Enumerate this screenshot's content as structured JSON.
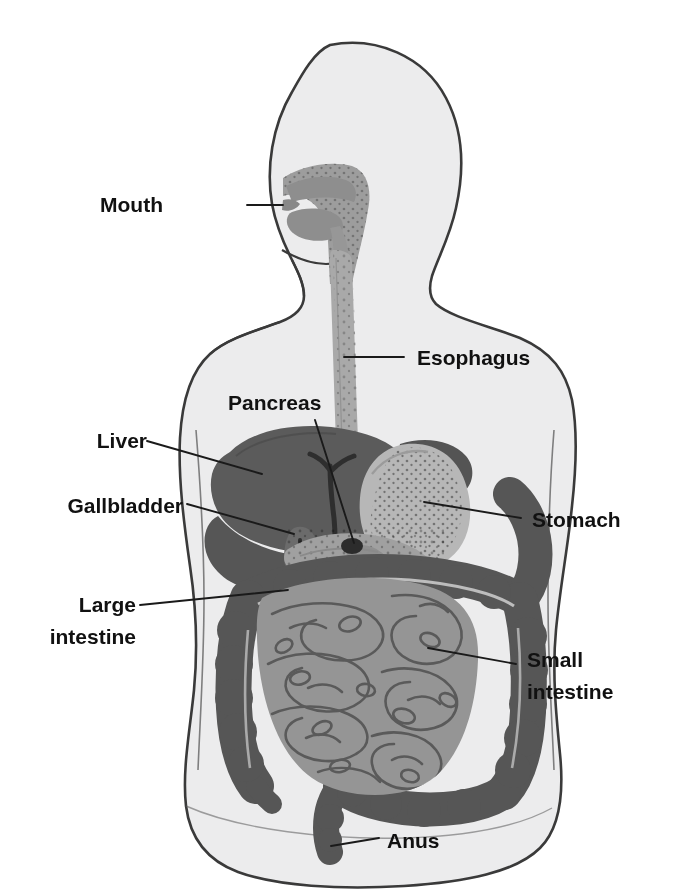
{
  "figure": {
    "type": "anatomical-diagram",
    "orientation": "anterior view of torso with lateral head"
  },
  "colors": {
    "background": "#ffffff",
    "body_fill": "#ececed",
    "body_outline": "#3a3a3a",
    "liver": "#5c5c5c",
    "gallbladder": "#6e6e6e",
    "stomach": "#b6b6b6",
    "stomach_speckle": "#7d7d7d",
    "esophagus": "#a8a8a8",
    "pancreas": "#9e9e9e",
    "small_intestine": "#949494",
    "small_intestine_outline": "#5a5a5a",
    "large_intestine": "#565656",
    "oral_cavity": "#9a9a9a",
    "label_text": "#111111",
    "leader_line": "#1a1a1a"
  },
  "labels": [
    {
      "id": "mouth",
      "text": "Mouth",
      "side": "left",
      "text_x": 163,
      "text_y": 212,
      "anchor": "start",
      "leader": "M 247 205 L 283 205",
      "organ": "oral cavity"
    },
    {
      "id": "pancreas",
      "text": "Pancreas",
      "side": "left",
      "text_x": 228,
      "text_y": 410,
      "anchor": "start",
      "leader": "M 315 420 L 354 543",
      "organ": "pancreas"
    },
    {
      "id": "liver",
      "text": "Liver",
      "side": "left",
      "text_x": 79,
      "text_y": 448,
      "anchor": "start",
      "leader": "M 147 441 L 262 474",
      "organ": "liver"
    },
    {
      "id": "gallbladder",
      "text": "Gallbladder",
      "side": "left",
      "text_x": 22,
      "text_y": 513,
      "anchor": "start",
      "leader": "M 187 504 L 288 532",
      "organ": "gallbladder"
    },
    {
      "id": "esophagus",
      "text": "Esophagus",
      "side": "right",
      "text_x": 417,
      "text_y": 365,
      "anchor": "start",
      "leader": "M 355 357 L 404 357",
      "organ": "esophagus"
    },
    {
      "id": "stomach",
      "text": "Stomach",
      "side": "right",
      "text_x": 532,
      "text_y": 525,
      "anchor": "start",
      "leader": "M 438 505 L 521 518",
      "organ": "stomach"
    },
    {
      "id": "large-intestine",
      "text": "Large intestine",
      "line1": "Large",
      "line2": "intestine",
      "side": "left",
      "text_x": 66,
      "text_y": 609,
      "anchor": "start",
      "leader": "M 140 605 L 285 592",
      "organ": "large intestine"
    },
    {
      "id": "small-intestine",
      "text": "Small intestine",
      "line1": "Small",
      "line2": "intestine",
      "side": "right",
      "text_x": 527,
      "text_y": 665,
      "anchor": "start",
      "leader": "M 432 650 L 516 664",
      "organ": "small intestine"
    },
    {
      "id": "anus",
      "text": "Anus",
      "side": "right",
      "text_x": 387,
      "text_y": 848,
      "anchor": "start",
      "leader": "M 337 842 L 379 838",
      "organ": "anus"
    }
  ]
}
